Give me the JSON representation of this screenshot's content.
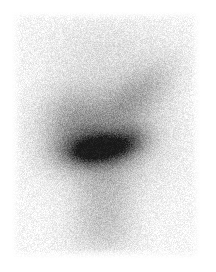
{
  "document": {
    "kind": "nuclear-medicine-scintigram",
    "modality_label": "Scintigraphy",
    "orientation": "anterior",
    "caption": "",
    "background_color": "#ffffff",
    "film_background_color": "#fbfbfb"
  },
  "image_frame": {
    "page_width": 216,
    "page_height": 272,
    "film_left": 12,
    "film_top": 12,
    "film_width": 188,
    "film_height": 247
  },
  "palette": {
    "paper_white": "#ffffff",
    "film_base": "#fafafa",
    "low_uptake_gray": "#e6e6e6",
    "mid_uptake_gray": "#b8b8b8",
    "high_uptake_gray": "#8a8a8a",
    "hotspot_dark": "#5a5a5a",
    "hotspot_core": "#4a4a4a"
  },
  "render_params": {
    "noise_grain_amount": 0.3,
    "noise_grain_scale": 1.0,
    "blur_sigma": 1.1,
    "base_level": 247,
    "seed": 20240517
  },
  "chart_data": {
    "type": "heatmap",
    "title": "",
    "xlabel": "",
    "ylabel": "",
    "colormap": "grayscale-inverted",
    "value_label": "relative radiotracer uptake",
    "grid": false,
    "legend": "none",
    "xlim": [
      0,
      188
    ],
    "ylim": [
      0,
      247
    ],
    "features": [
      {
        "name": "diffuse-uptake-halo",
        "shape": "ellipse",
        "cx": 93,
        "cy": 119,
        "rx": 62,
        "ry": 60,
        "rotation_deg": -12,
        "intensity": 0.34,
        "falloff": 2.0
      },
      {
        "name": "upper-right-diagonal-band",
        "shape": "ellipse",
        "cx": 128,
        "cy": 80,
        "rx": 48,
        "ry": 23,
        "rotation_deg": -38,
        "intensity": 0.26,
        "falloff": 2.0
      },
      {
        "name": "left-shoulder-lobe",
        "shape": "ellipse",
        "cx": 58,
        "cy": 112,
        "rx": 34,
        "ry": 38,
        "rotation_deg": 10,
        "intensity": 0.22,
        "falloff": 2.1
      },
      {
        "name": "focal-hotspot",
        "shape": "ellipse",
        "cx": 85,
        "cy": 136,
        "rx": 36,
        "ry": 18,
        "rotation_deg": -6,
        "intensity": 0.78,
        "falloff": 1.7
      },
      {
        "name": "focal-hotspot-core",
        "shape": "ellipse",
        "cx": 80,
        "cy": 138,
        "rx": 22,
        "ry": 11,
        "rotation_deg": -8,
        "intensity": 0.58,
        "falloff": 1.6
      },
      {
        "name": "hotspot-right-extension",
        "shape": "ellipse",
        "cx": 114,
        "cy": 130,
        "rx": 24,
        "ry": 15,
        "rotation_deg": -22,
        "intensity": 0.4,
        "falloff": 1.9
      },
      {
        "name": "inferior-column",
        "shape": "ellipse",
        "cx": 92,
        "cy": 186,
        "rx": 34,
        "ry": 44,
        "rotation_deg": 0,
        "intensity": 0.2,
        "falloff": 2.3
      },
      {
        "name": "inferior-tail",
        "shape": "ellipse",
        "cx": 88,
        "cy": 222,
        "rx": 42,
        "ry": 26,
        "rotation_deg": 0,
        "intensity": 0.11,
        "falloff": 2.4
      },
      {
        "name": "superior-faint-field",
        "shape": "ellipse",
        "cx": 96,
        "cy": 34,
        "rx": 72,
        "ry": 34,
        "rotation_deg": 0,
        "intensity": 0.08,
        "falloff": 2.5
      }
    ]
  }
}
